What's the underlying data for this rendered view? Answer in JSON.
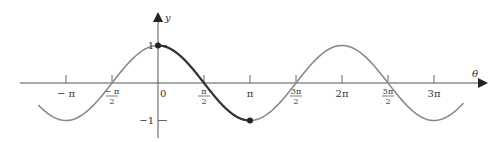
{
  "chart_data": {
    "type": "line",
    "title": "",
    "function": "y = cos(theta)",
    "xlabel": "θ",
    "ylabel": "y",
    "xlim_pi": [
      -1.3,
      3.32
    ],
    "ylim": [
      -1,
      1
    ],
    "x_ticks": [
      {
        "value_pi": -1,
        "label": "− π"
      },
      {
        "value_pi": -0.5,
        "label_num": "− π",
        "label_den": "2"
      },
      {
        "value_pi": 0,
        "label": "0"
      },
      {
        "value_pi": 0.5,
        "label_num": "π",
        "label_den": "2"
      },
      {
        "value_pi": 1,
        "label": "π"
      },
      {
        "value_pi": 1.5,
        "label_num": "3π",
        "label_den": "2"
      },
      {
        "value_pi": 2,
        "label": "2π"
      },
      {
        "value_pi": 2.5,
        "label_num": "5π",
        "label_den": "2"
      },
      {
        "value_pi": 3,
        "label": "3π"
      }
    ],
    "y_ticks": [
      {
        "value": 1,
        "label": "1"
      },
      {
        "value": -1,
        "label": "−1"
      }
    ],
    "series": [
      {
        "name": "cos θ",
        "x_pi_range": [
          -1.3,
          3.32
        ],
        "style": "light"
      },
      {
        "name": "highlighted cos θ on [0, π]",
        "x_pi_range": [
          0,
          1
        ],
        "style": "dark"
      }
    ],
    "points": [
      {
        "x_pi": 0,
        "y": 1
      },
      {
        "x_pi": 1,
        "y": -1
      }
    ],
    "grid": false,
    "legend": "none"
  }
}
